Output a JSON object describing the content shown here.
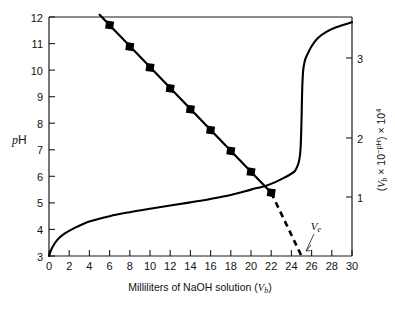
{
  "figure": {
    "background_color": "#ffffff",
    "line_color": "#000000",
    "text_color": "#111111"
  },
  "axes": {
    "x": {
      "label_prefix": "Milliliters of NaOH solution (",
      "label_var": "V",
      "label_sub": "b",
      "label_suffix": ")",
      "label_full": "Milliliters of NaOH solution (Vb)",
      "ticks": [
        "0",
        "2",
        "4",
        "6",
        "8",
        "10",
        "12",
        "14",
        "16",
        "18",
        "20",
        "22",
        "24",
        "26",
        "28",
        "30"
      ],
      "min": 0,
      "max": 30
    },
    "y_left": {
      "label_italic": "p",
      "label_rest": "H",
      "label_full": "pH",
      "ticks": [
        "3",
        "4",
        "5",
        "6",
        "7",
        "8",
        "9",
        "10",
        "11",
        "12"
      ],
      "min": 3,
      "max": 12
    },
    "y_right": {
      "label_full": "(Vb × 10−pH) × 104",
      "label_parts": {
        "open": "(",
        "var": "V",
        "sub": "b",
        "times1": " × 10",
        "exp1": "−pH",
        "close": ")",
        "times2": " × 10",
        "exp2": "4"
      },
      "ticks": [
        "1",
        "2",
        "3"
      ],
      "tick_values": [
        1,
        2,
        3
      ],
      "min": 0,
      "max": 3.55
    }
  },
  "annotations": [
    {
      "name": "equivalence-volume",
      "text_var": "V",
      "text_sub": "e",
      "text_full": "Ve",
      "value_ml": 25
    }
  ],
  "chart_data": {
    "type": "line",
    "title": "",
    "xlabel": "Milliliters of NaOH solution (Vb)",
    "ylabel": "pH",
    "ylabel_right": "(Vb × 10−pH) × 10^4",
    "xlim": [
      0,
      30
    ],
    "ylim": [
      3,
      12
    ],
    "ylim_right": [
      0,
      3.55
    ],
    "grid": false,
    "legend": "none",
    "series": [
      {
        "name": "Titration curve (pH vs volume)",
        "type": "line",
        "axis": "left",
        "style": "solid",
        "markers": false,
        "x": [
          0,
          0.3,
          0.8,
          1.5,
          2.5,
          4,
          6,
          8,
          10,
          12,
          14,
          16,
          18,
          20,
          21.5,
          22.5,
          23.3,
          24,
          24.5,
          24.9,
          25.1,
          25.3,
          25.6,
          26,
          26.6,
          27.5,
          28.5,
          30
        ],
        "y": [
          3.0,
          3.3,
          3.6,
          3.83,
          4.05,
          4.3,
          4.5,
          4.65,
          4.78,
          4.9,
          5.02,
          5.15,
          5.3,
          5.5,
          5.65,
          5.8,
          5.95,
          6.1,
          6.3,
          7.0,
          9.6,
          10.3,
          10.6,
          10.9,
          11.2,
          11.45,
          11.62,
          11.8
        ]
      },
      {
        "name": "Gran plot (Vb × 10^−pH)",
        "type": "line",
        "axis": "right",
        "style": "solid-with-dashed-extrapolation",
        "markers": true,
        "marker_shape": "square",
        "x": [
          6,
          8,
          10,
          12,
          14,
          16,
          18,
          20,
          22
        ],
        "gran_value_e4": [
          3.43,
          3.11,
          2.8,
          2.49,
          2.18,
          1.87,
          1.56,
          1.25,
          0.94
        ],
        "ph_at_point": [
          11.38,
          10.47,
          9.63,
          8.78,
          7.85,
          7.23,
          6.35,
          5.46,
          4.5
        ],
        "extrapolation_x": [
          22,
          25
        ],
        "extrapolation_intercept_x": 25
      }
    ]
  }
}
